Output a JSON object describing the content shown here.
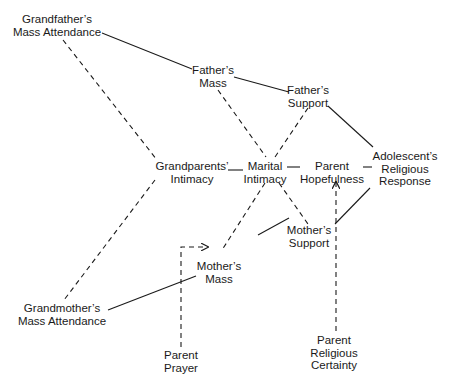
{
  "diagram": {
    "type": "path-diagram",
    "nodes": [
      {
        "id": "gf_mass",
        "line1": "Grandfather’s",
        "line2": "Mass Attendance",
        "x": 57,
        "y": 19
      },
      {
        "id": "f_mass",
        "line1": "Father’s",
        "line2": "Mass",
        "x": 218,
        "y": 67
      },
      {
        "id": "f_support",
        "line1": "Father’s",
        "line2": "Support",
        "x": 308,
        "y": 85
      },
      {
        "id": "gp_intimacy",
        "line1": "Grandparents’",
        "line2": "Intimacy",
        "x": 191,
        "y": 160
      },
      {
        "id": "marital",
        "line1": "Marital",
        "line2": "Intimacy",
        "x": 270,
        "y": 160
      },
      {
        "id": "hope",
        "line1": "Parent",
        "line2": "Hopefulness",
        "x": 331,
        "y": 160
      },
      {
        "id": "adol",
        "line1": "Adolescent’s",
        "line2": "Religious",
        "line3": "Response",
        "x": 405,
        "y": 151
      },
      {
        "id": "m_support",
        "line1": "Mother’s",
        "line2": "Support",
        "x": 318,
        "y": 228
      },
      {
        "id": "m_mass",
        "line1": "Mother’s",
        "line2": "Mass",
        "x": 236,
        "y": 261
      },
      {
        "id": "gm_mass",
        "line1": "Grandmother’s",
        "line2": "Mass Attendance",
        "x": 63,
        "y": 300
      },
      {
        "id": "prayer",
        "line1": "Parent",
        "line2": "Prayer",
        "x": 181,
        "y": 351
      },
      {
        "id": "certainty",
        "line1": "Parent",
        "line2": "Religious",
        "line3": "Certainty",
        "x": 334,
        "y": 336
      }
    ],
    "edges": [
      {
        "from": "gf_mass",
        "to": "f_mass",
        "style": "solid"
      },
      {
        "from": "f_mass",
        "to": "f_support",
        "style": "solid"
      },
      {
        "from": "f_support",
        "to": "adol",
        "style": "solid"
      },
      {
        "from": "gf_mass",
        "to": "gp_intimacy",
        "style": "dashed"
      },
      {
        "from": "f_mass",
        "to": "marital",
        "style": "dashed"
      },
      {
        "from": "f_support",
        "to": "marital",
        "style": "dashed"
      },
      {
        "from": "gp_intimacy",
        "to": "marital",
        "style": "solid"
      },
      {
        "from": "marital",
        "to": "hope",
        "style": "solid"
      },
      {
        "from": "hope",
        "to": "adol",
        "style": "solid"
      },
      {
        "from": "gp_intimacy",
        "to": "gm_mass",
        "style": "dashed"
      },
      {
        "from": "marital",
        "to": "m_mass",
        "style": "dashed"
      },
      {
        "from": "marital",
        "to": "m_support",
        "style": "dashed"
      },
      {
        "from": "m_support",
        "to": "adol",
        "style": "solid"
      },
      {
        "from": "m_mass",
        "to": "m_support",
        "style": "solid"
      },
      {
        "from": "gm_mass",
        "to": "m_mass",
        "style": "solid"
      },
      {
        "from": "prayer",
        "to": "m_mass",
        "style": "dashed-arrow"
      },
      {
        "from": "certainty",
        "to": "hope",
        "style": "dashed-arrow"
      }
    ]
  },
  "labels": {
    "gf_mass": {
      "l1": "Grandfather’s",
      "l2": "Mass Attendance"
    },
    "f_mass": {
      "l1": "Father’s",
      "l2": "Mass"
    },
    "f_support": {
      "l1": "Father’s",
      "l2": "Support"
    },
    "gp_intimacy": {
      "l1": "Grandparents’",
      "l2": "Intimacy"
    },
    "marital": {
      "l1": "Marital",
      "l2": "Intimacy"
    },
    "hope": {
      "l1": "Parent",
      "l2": "Hopefulness"
    },
    "adol": {
      "l1": "Adolescent’s",
      "l2": "Religious",
      "l3": "Response"
    },
    "m_support": {
      "l1": "Mother’s",
      "l2": "Support"
    },
    "m_mass": {
      "l1": "Mother’s",
      "l2": "Mass"
    },
    "gm_mass": {
      "l1": "Grandmother’s",
      "l2": "Mass Attendance"
    },
    "prayer": {
      "l1": "Parent",
      "l2": "Prayer"
    },
    "certainty": {
      "l1": "Parent",
      "l2": "Religious",
      "l3": "Certainty"
    }
  },
  "colors": {
    "ink": "#1a1a1a",
    "background": "#ffffff"
  }
}
